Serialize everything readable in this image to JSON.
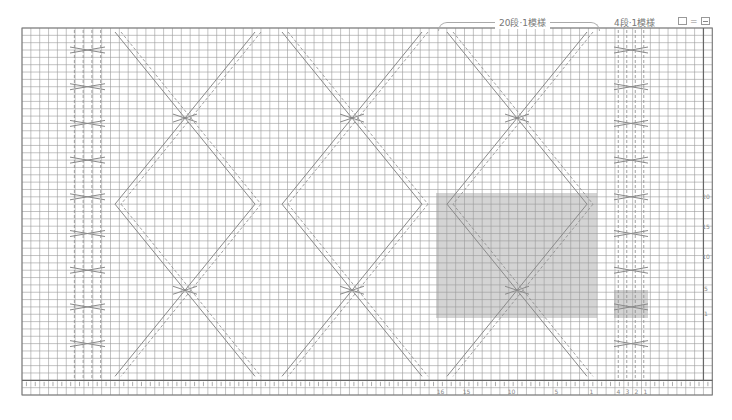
{
  "header": {
    "repeat_label_20": "20段·1模様",
    "repeat_label_4": "4段·1模様"
  },
  "legend": {
    "equals": "="
  },
  "grid": {
    "left": 22,
    "top": 28,
    "cols": 78,
    "rows": 50,
    "cell_w": 8.85,
    "cell_h": 7.34,
    "line_color": "#9a9a9a",
    "shade_color": "#d4d4d4",
    "symbol_color": "#8a8a8a"
  },
  "row_numbers": [
    {
      "label": "20",
      "y": 197
    },
    {
      "label": "15",
      "y": 227
    },
    {
      "label": "10",
      "y": 257
    },
    {
      "label": "5",
      "y": 289
    },
    {
      "label": "1",
      "y": 314
    }
  ],
  "col_numbers": [
    {
      "label": "16",
      "x": 440
    },
    {
      "label": "15",
      "x": 466
    },
    {
      "label": "10",
      "x": 511
    },
    {
      "label": "5",
      "x": 556
    },
    {
      "label": "1",
      "x": 591
    },
    {
      "label": "4",
      "x": 618
    },
    {
      "label": "3",
      "x": 627
    },
    {
      "label": "2",
      "x": 636
    },
    {
      "label": "1",
      "x": 645
    }
  ],
  "shaded_regions": [
    {
      "name": "repeat-20-row",
      "x": 436,
      "y": 193,
      "w": 161,
      "h": 125
    },
    {
      "name": "repeat-4-row",
      "x": 614,
      "y": 290,
      "w": 34,
      "h": 28
    }
  ],
  "small_cables": [
    {
      "x": 70,
      "w": 35
    },
    {
      "x": 614,
      "w": 34
    }
  ],
  "lattice_panels": [
    {
      "x": 105,
      "w": 160
    },
    {
      "x": 272,
      "w": 160
    },
    {
      "x": 437,
      "w": 160
    }
  ]
}
